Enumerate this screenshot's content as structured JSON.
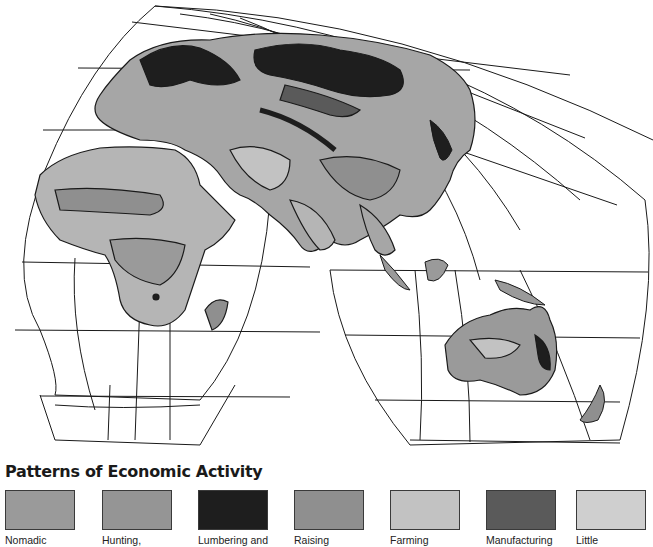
{
  "map": {
    "projection": "interrupted world map (Eastern Hemisphere: Europe, Africa, Asia, Australia)",
    "regions_visible": [
      "Europe",
      "Russia / Siberia",
      "Middle East",
      "Africa",
      "Madagascar",
      "India",
      "China",
      "Southeast Asia",
      "Indonesia",
      "Japan",
      "New Guinea",
      "Australia",
      "New Zealand"
    ],
    "graticule_color": "#1a1a1a",
    "ocean_color": "#ffffff"
  },
  "legend": {
    "title": "Patterns of Economic Activity",
    "items": [
      {
        "label": "Nomadic",
        "color": "#9a9a9a"
      },
      {
        "label": "Hunting,",
        "color": "#959595"
      },
      {
        "label": "Lumbering and",
        "color": "#1e1e1e"
      },
      {
        "label": "Raising",
        "color": "#8f8f8f"
      },
      {
        "label": "Farming",
        "color": "#c2c2c2"
      },
      {
        "label": "Manufacturing",
        "color": "#5a5a5a"
      },
      {
        "label": "Little",
        "color": "#cfcfcf"
      }
    ]
  }
}
